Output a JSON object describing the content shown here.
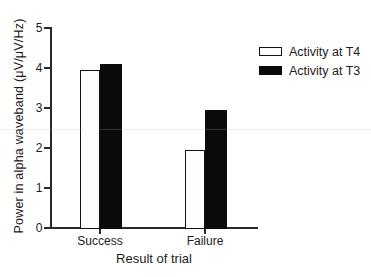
{
  "chart_data": {
    "type": "bar",
    "title": "",
    "xlabel": "Result of trial",
    "ylabel": "Power in alpha waveband (μV/μV/Hz)",
    "categories": [
      "Success",
      "Failure"
    ],
    "series": [
      {
        "name": "Activity at T4",
        "fill": "#ffffff",
        "values": [
          3.95,
          1.95
        ]
      },
      {
        "name": "Activity at T3",
        "fill": "#0a0a0a",
        "values": [
          4.1,
          2.95
        ]
      }
    ],
    "ylim": [
      0,
      5
    ],
    "yticks": [
      0,
      1,
      2,
      3,
      4,
      5
    ],
    "grid": false,
    "legend_position": "upper-right",
    "colors": {
      "axis": "#2a2a2a",
      "text": "#1b1b1b",
      "bar_filled": "#0a0a0a",
      "bar_outline_fill": "#ffffff"
    }
  }
}
